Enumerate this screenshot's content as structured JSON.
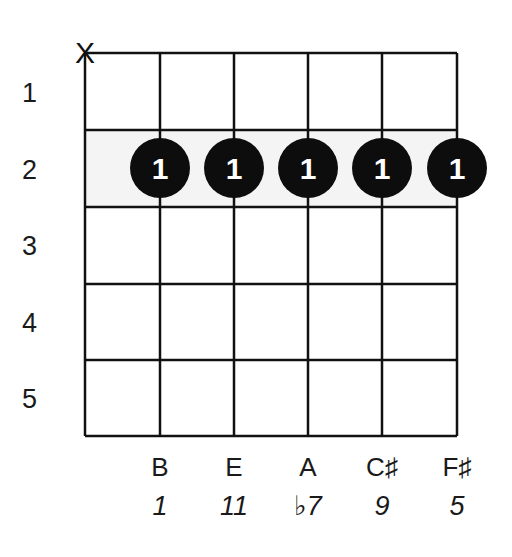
{
  "diagram": {
    "type": "guitar-chord-chart",
    "strings": 6,
    "frets_shown": 5,
    "fret_labels": [
      "1",
      "2",
      "3",
      "4",
      "5"
    ],
    "muted_string_marker": "X",
    "muted_string": 1,
    "highlighted_fret": 2,
    "finger_dots": [
      {
        "string": 2,
        "fret": 2,
        "finger": "1"
      },
      {
        "string": 3,
        "fret": 2,
        "finger": "1"
      },
      {
        "string": 4,
        "fret": 2,
        "finger": "1"
      },
      {
        "string": 5,
        "fret": 2,
        "finger": "1"
      },
      {
        "string": 6,
        "fret": 2,
        "finger": "1"
      }
    ],
    "note_names": [
      "B",
      "E",
      "A",
      "C♯",
      "F♯"
    ],
    "intervals": [
      "1",
      "11",
      "♭7",
      "9",
      "5"
    ],
    "colors": {
      "grid": "#111111",
      "dot": "#0d0d0d",
      "dot_text": "#ffffff",
      "highlight_row": "#f2f2f2"
    }
  }
}
